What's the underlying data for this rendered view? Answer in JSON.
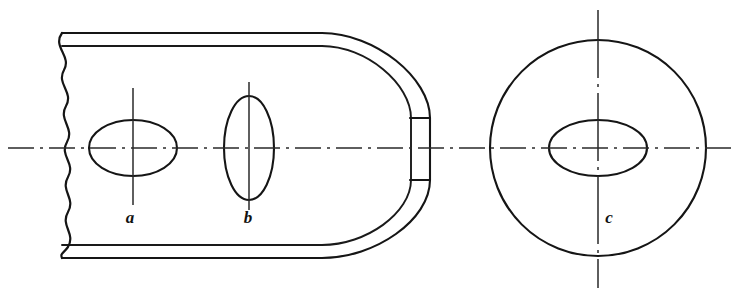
{
  "figure": {
    "background_color": "#ffffff",
    "line_color": "#151515",
    "centerline_color": "#2a2a2a",
    "width": 739,
    "height": 296
  },
  "labels": [
    {
      "id": "a",
      "text": "a",
      "x": 130,
      "y": 223,
      "describes": "horizontal ellipse hole in front view"
    },
    {
      "id": "b",
      "text": "b",
      "x": 248,
      "y": 223,
      "describes": "vertical ellipse hole in front view"
    },
    {
      "id": "c",
      "text": "c",
      "x": 609,
      "y": 223,
      "describes": "horizontal ellipse hole in end view circle"
    }
  ],
  "views": {
    "front_view": {
      "name": "front-view-bar",
      "break_edge_x": 62,
      "top_outer_y": 33,
      "top_inner_y": 46,
      "bottom_inner_y": 245,
      "bottom_outer_y": 258,
      "right_tip_x": 430,
      "corner_radius_outer": 108,
      "corner_radius_inner": 95,
      "notch": {
        "top_y": 118,
        "bottom_y": 180,
        "x_inner": 411,
        "x_outer": 430
      }
    },
    "end_view": {
      "name": "end-view-circle",
      "center_x": 598,
      "center_y": 148,
      "radius": 108
    }
  },
  "ellipses": [
    {
      "id": "a",
      "cx": 133,
      "cy": 148,
      "rx": 44,
      "ry": 28,
      "orientation": "horizontal"
    },
    {
      "id": "b",
      "cx": 249,
      "cy": 148,
      "rx": 25,
      "ry": 52,
      "orientation": "vertical"
    },
    {
      "id": "c",
      "cx": 598,
      "cy": 148,
      "rx": 49,
      "ry": 28,
      "orientation": "horizontal"
    }
  ],
  "centerlines": {
    "main_horizontal": {
      "y": 148,
      "x1": 8,
      "x2": 733,
      "style": "dash-dot"
    },
    "vertical_a": {
      "x": 133,
      "y1": 88,
      "y2": 205,
      "style": "solid"
    },
    "vertical_b": {
      "x": 249,
      "y1": 82,
      "y2": 210,
      "style": "solid"
    },
    "vertical_c": {
      "x": 598,
      "y1": 10,
      "y2": 288,
      "style": "dash-dot"
    }
  }
}
